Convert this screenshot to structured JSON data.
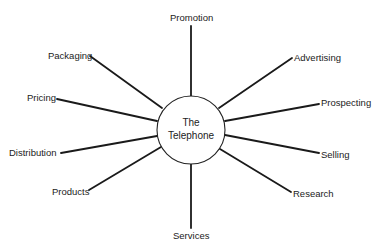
{
  "diagram": {
    "center": {
      "line1": "The",
      "line2": "Telephone",
      "cx": 191,
      "cy": 130,
      "r": 34
    },
    "spokes": [
      {
        "label": "Promotion",
        "x1": 191,
        "y1": 26,
        "x2": 191,
        "y2": 96
      },
      {
        "label": "Advertising",
        "x1": 292,
        "y1": 58,
        "x2": 219,
        "y2": 108
      },
      {
        "label": "Prospecting",
        "x1": 319,
        "y1": 104,
        "x2": 225,
        "y2": 121
      },
      {
        "label": "Selling",
        "x1": 319,
        "y1": 153,
        "x2": 225,
        "y2": 135
      },
      {
        "label": "Research",
        "x1": 291,
        "y1": 192,
        "x2": 220,
        "y2": 149
      },
      {
        "label": "Services",
        "x1": 191,
        "y1": 228,
        "x2": 191,
        "y2": 164
      },
      {
        "label": "Products",
        "x1": 89,
        "y1": 190,
        "x2": 161,
        "y2": 147
      },
      {
        "label": "Distribution",
        "x1": 61,
        "y1": 153,
        "x2": 157,
        "y2": 136
      },
      {
        "label": "Pricing",
        "x1": 57,
        "y1": 99,
        "x2": 157,
        "y2": 121
      },
      {
        "label": "Packaging",
        "x1": 90,
        "y1": 56,
        "x2": 162,
        "y2": 108
      }
    ],
    "labels": {
      "promotion": "Promotion",
      "advertising": "Advertising",
      "prospecting": "Prospecting",
      "selling": "Selling",
      "research": "Research",
      "services": "Services",
      "products": "Products",
      "distribution": "Distribution",
      "pricing": "Pricing",
      "packaging": "Packaging"
    },
    "colors": {
      "line": "#1a1a1a",
      "text": "#222222",
      "background": "#ffffff"
    }
  }
}
